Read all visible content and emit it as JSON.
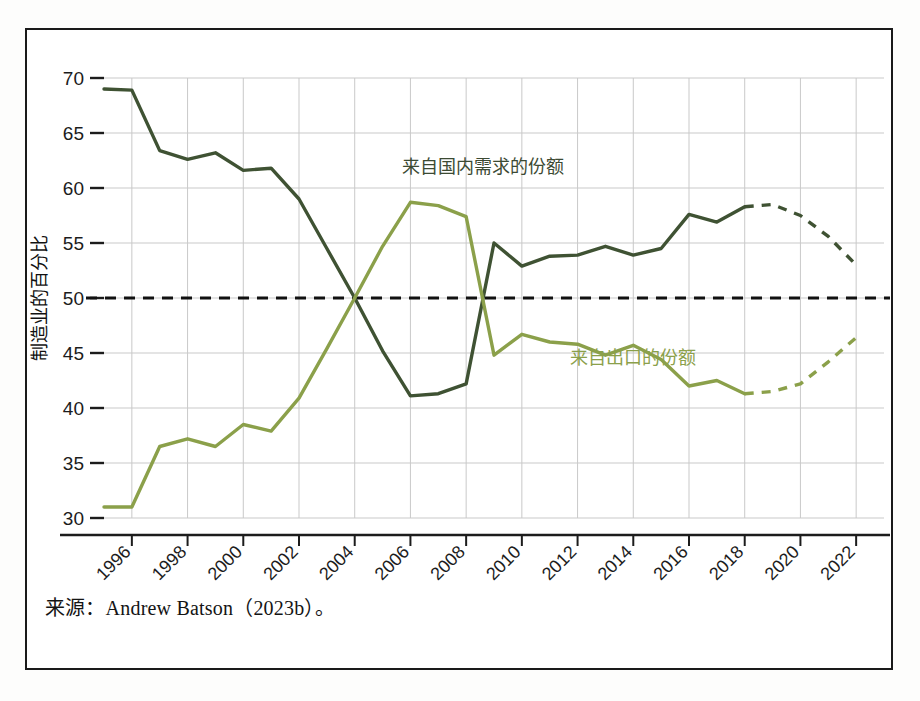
{
  "figure": {
    "source_note": "来源：Andrew Batson（2023b）。",
    "frame_color": "#1a1a1a",
    "background": "#ffffff"
  },
  "chart_data": {
    "type": "line",
    "title": "",
    "subtitle": "",
    "xlabel": "",
    "ylabel": "制造业的百分比",
    "xlim": [
      1995,
      2023
    ],
    "ylim": [
      29,
      71
    ],
    "yticks": [
      30,
      35,
      40,
      45,
      50,
      55,
      60,
      65,
      70
    ],
    "xticks": [
      1996,
      1998,
      2000,
      2002,
      2004,
      2006,
      2008,
      2010,
      2012,
      2014,
      2016,
      2018,
      2020,
      2022
    ],
    "grid": true,
    "grid_color": "#c9c9c9",
    "legend_position": "inline-labels",
    "reference_line": {
      "value": 50,
      "style": "dashed",
      "color": "#111111",
      "label": ""
    },
    "x": [
      1995,
      1996,
      1997,
      1998,
      1999,
      2000,
      2001,
      2002,
      2003,
      2004,
      2005,
      2006,
      2007,
      2008,
      2009,
      2010,
      2011,
      2012,
      2013,
      2014,
      2015,
      2016,
      2017,
      2018,
      2019,
      2020,
      2021,
      2022
    ],
    "series": [
      {
        "name": "来自国内需求的份额",
        "color": "#3f5233",
        "label_x": 2008.6,
        "label_y": 61.4,
        "solid_through": 2018,
        "values": [
          69.0,
          68.9,
          63.4,
          62.6,
          63.2,
          61.6,
          61.8,
          59.0,
          54.5,
          50.0,
          45.2,
          41.1,
          41.3,
          42.2,
          55.0,
          52.9,
          53.8,
          53.9,
          54.7,
          53.9,
          54.5,
          57.6,
          56.9,
          58.3,
          58.5,
          57.5,
          55.6,
          53.0
        ],
        "projection_note": "dashed after 2018"
      },
      {
        "name": "来自出口的份额",
        "color": "#8ba04a",
        "label_x": 2014.0,
        "label_y": 44.0,
        "solid_through": 2018,
        "values": [
          31.0,
          31.0,
          36.5,
          37.2,
          36.5,
          38.5,
          37.9,
          40.9,
          45.4,
          50.0,
          54.7,
          58.7,
          58.4,
          57.4,
          44.8,
          46.7,
          46.0,
          45.8,
          44.8,
          45.7,
          44.4,
          42.0,
          42.5,
          41.3,
          41.5,
          42.2,
          44.2,
          46.4
        ],
        "projection_note": "dashed after 2018"
      }
    ]
  },
  "axis": {
    "y_title": "制造业的百分比",
    "y_tick_labels": [
      "70",
      "65",
      "60",
      "55",
      "50",
      "45",
      "40",
      "35",
      "30"
    ],
    "x_tick_labels": [
      "1996",
      "1998",
      "2000",
      "2002",
      "2004",
      "2006",
      "2008",
      "2010",
      "2012",
      "2014",
      "2016",
      "2018",
      "2020",
      "2022"
    ]
  },
  "labels": {
    "domestic_demand": "来自国内需求的份额",
    "exports": "来自出口的份额"
  }
}
